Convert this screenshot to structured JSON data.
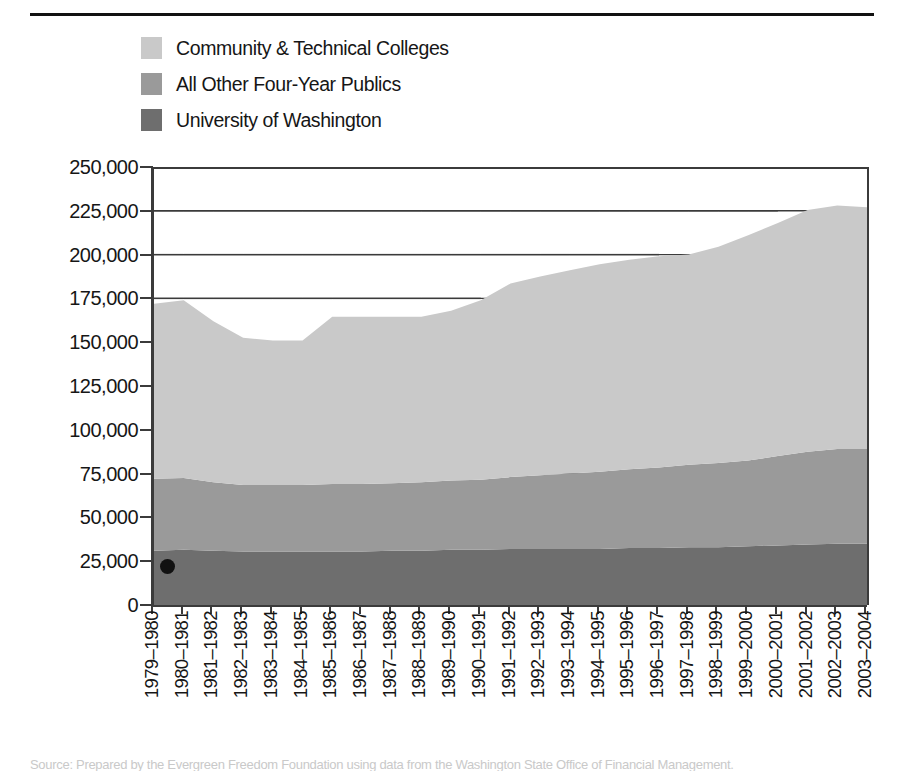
{
  "legend": {
    "items": [
      {
        "label": "Community & Technical Colleges",
        "color": "#c9c9c9"
      },
      {
        "label": "All Other Four-Year Publics",
        "color": "#9a9a9a"
      },
      {
        "label": "University of Washington",
        "color": "#6e6e6e"
      }
    ]
  },
  "caption": {
    "text": "Source: Prepared by the Evergreen Freedom Foundation using data from the Washington State Office of Financial Management."
  },
  "chart_data": {
    "type": "area",
    "stacked": true,
    "title": "",
    "xlabel": "",
    "ylabel": "",
    "ylim": [
      0,
      250000
    ],
    "ytick_labels": [
      "250,000",
      "225,000",
      "200,000",
      "175,000",
      "150,000",
      "125,000",
      "100,000",
      "75,000",
      "50,000",
      "25,000",
      "0"
    ],
    "ytick_values": [
      250000,
      225000,
      200000,
      175000,
      150000,
      125000,
      100000,
      75000,
      50000,
      25000,
      0
    ],
    "grid": true,
    "grid_axis": "y",
    "legend_position": "top-left",
    "categories": [
      "1979–1980",
      "1980–1981",
      "1981–1982",
      "1982–1983",
      "1983–1984",
      "1984–1985",
      "1985–1986",
      "1986–1987",
      "1987–1988",
      "1988–1989",
      "1989–1990",
      "1990–1991",
      "1991–1992",
      "1992–1993",
      "1993–1994",
      "1994–1995",
      "1995–1996",
      "1996–1997",
      "1997–1998",
      "1998–1999",
      "1999–2000",
      "2000–2001",
      "2001–2002",
      "2002–2003",
      "2003–2004"
    ],
    "series": [
      {
        "name": "University of Washington",
        "color": "#6e6e6e",
        "values": [
          31000,
          31500,
          31000,
          30500,
          30500,
          30500,
          30500,
          30500,
          31000,
          31000,
          31500,
          31500,
          32000,
          32000,
          32000,
          32000,
          32500,
          32500,
          33000,
          33000,
          33500,
          34000,
          34500,
          35000,
          35000
        ]
      },
      {
        "name": "All Other Four-Year Publics",
        "color": "#9a9a9a",
        "values": [
          41000,
          41000,
          39000,
          38000,
          38000,
          38000,
          38500,
          38500,
          38500,
          39000,
          39500,
          40000,
          41000,
          42000,
          43000,
          44000,
          45000,
          46000,
          47000,
          48000,
          49000,
          51000,
          53000,
          54000,
          54000
        ]
      },
      {
        "name": "Community & Technical Colleges",
        "color": "#c9c9c9",
        "values": [
          100000,
          101500,
          92000,
          84000,
          82500,
          82500,
          95500,
          95500,
          95000,
          94500,
          97000,
          102500,
          110500,
          113500,
          116000,
          118500,
          119500,
          120500,
          120000,
          123500,
          128500,
          133000,
          138000,
          139000,
          138000
        ]
      }
    ],
    "totals": [
      172000,
      174000,
      162000,
      152500,
      151000,
      151000,
      164500,
      164500,
      164500,
      164500,
      168000,
      174000,
      183500,
      187500,
      191000,
      194500,
      197000,
      199000,
      200000,
      204500,
      211000,
      218000,
      225500,
      228000,
      227000
    ],
    "annotations": [
      {
        "type": "dot",
        "x_category": "1979–1980",
        "y_value": 22000,
        "color": "#111111"
      }
    ]
  }
}
